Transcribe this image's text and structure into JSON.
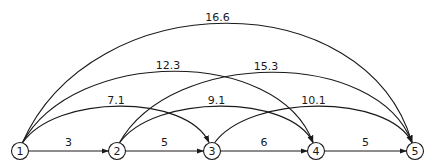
{
  "diagram": {
    "type": "directed-graph",
    "nodes": [
      {
        "id": "1",
        "label": "1"
      },
      {
        "id": "2",
        "label": "2"
      },
      {
        "id": "3",
        "label": "3"
      },
      {
        "id": "4",
        "label": "4"
      },
      {
        "id": "5",
        "label": "5"
      }
    ],
    "edges": [
      {
        "from": "1",
        "to": "2",
        "label": "3",
        "style": "straight"
      },
      {
        "from": "2",
        "to": "3",
        "label": "5",
        "style": "straight"
      },
      {
        "from": "3",
        "to": "4",
        "label": "6",
        "style": "straight"
      },
      {
        "from": "4",
        "to": "5",
        "label": "5",
        "style": "straight"
      },
      {
        "from": "1",
        "to": "3",
        "label": "7.1",
        "style": "arc"
      },
      {
        "from": "2",
        "to": "4",
        "label": "9.1",
        "style": "arc"
      },
      {
        "from": "3",
        "to": "5",
        "label": "10.1",
        "style": "arc"
      },
      {
        "from": "1",
        "to": "4",
        "label": "12.3",
        "style": "arc"
      },
      {
        "from": "2",
        "to": "5",
        "label": "15.3",
        "style": "arc"
      },
      {
        "from": "1",
        "to": "5",
        "label": "16.6",
        "style": "arc"
      }
    ],
    "colors": {
      "stroke": "#1a1a1a",
      "background": "#ffffff"
    }
  }
}
